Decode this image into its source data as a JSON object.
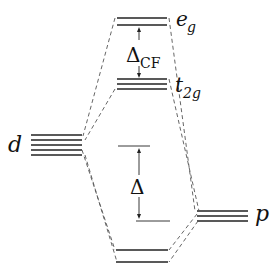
{
  "diagram": {
    "levels": {
      "eg": {
        "label_main": "e",
        "label_sub": "g",
        "lines": 2
      },
      "t2g": {
        "label_main": "t",
        "label_sub": "2g",
        "lines": 3
      },
      "d": {
        "label": "d",
        "lines": 5
      },
      "p": {
        "label": "p",
        "lines": 3
      },
      "bonding": {
        "lines": 2
      }
    },
    "gaps": {
      "crystal_field": {
        "symbol": "Δ",
        "subscript": "CF"
      },
      "delta": {
        "symbol": "Δ"
      }
    },
    "colors": {
      "line": "#222222",
      "dash": "#555555",
      "text": "#111111"
    }
  }
}
